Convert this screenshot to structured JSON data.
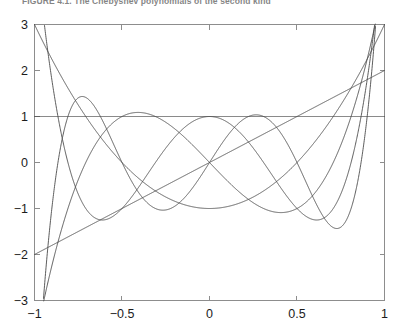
{
  "figure": {
    "top_caption": "FIGURE 4.1. The Chebyshev polynomials of the second kind",
    "background_color": "#ffffff",
    "axis_color": "#8d8d8d",
    "curve_color": "#4a4a4a"
  },
  "chart_data": {
    "type": "line",
    "title": "",
    "subtitle": "",
    "xlabel": "",
    "ylabel": "",
    "xlim": [
      -1,
      1
    ],
    "ylim": [
      -3,
      3
    ],
    "xticks": [
      -1,
      -0.5,
      0,
      0.5,
      1
    ],
    "xticklabels": [
      "−1",
      "−0.5",
      "0",
      "0.5",
      "1"
    ],
    "yticks": [
      -3,
      -2,
      -1,
      0,
      1,
      2,
      3
    ],
    "yticklabels": [
      "−3",
      "−2",
      "−1",
      "0",
      "1",
      "2",
      "3"
    ],
    "grid": false,
    "legend": "none",
    "box": true,
    "family": "Chebyshev polynomials of the second kind U_n(x)",
    "series": [
      {
        "name": "U0",
        "degree": 0,
        "formula": "1",
        "endpoint_left": 1,
        "endpoint_right": 1,
        "interior_extrema": 0
      },
      {
        "name": "U1",
        "degree": 1,
        "formula": "2x",
        "endpoint_left": -2,
        "endpoint_right": 2,
        "interior_extrema": 0
      },
      {
        "name": "U2",
        "degree": 2,
        "formula": "4x^2 - 1",
        "endpoint_left": 3,
        "endpoint_right": 3,
        "interior_extrema": 1
      },
      {
        "name": "U3",
        "degree": 3,
        "formula": "8x^3 - 4x",
        "endpoint_left": -4,
        "endpoint_right": 4,
        "interior_extrema": 2
      },
      {
        "name": "U4",
        "degree": 4,
        "formula": "16x^4 - 12x^2 + 1",
        "endpoint_left": 5,
        "endpoint_right": 5,
        "interior_extrema": 3
      },
      {
        "name": "U5",
        "degree": 5,
        "formula": "32x^5 - 32x^3 + 6x",
        "endpoint_left": -6,
        "endpoint_right": 6,
        "interior_extrema": 4
      }
    ]
  }
}
